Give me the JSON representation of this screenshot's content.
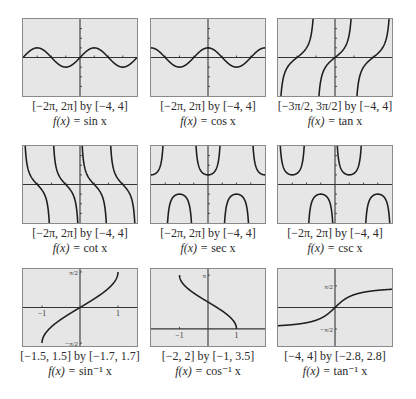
{
  "chart_data": [
    {
      "type": "line",
      "id": "sin",
      "title": "f(x) = sin x",
      "window_label": "[−2π, 2π] by [−4, 4]",
      "func_prefix": "f(x) = ",
      "func_name": "sin x",
      "xlim": [
        -6.2832,
        6.2832
      ],
      "ylim": [
        -4,
        4
      ],
      "x_ticks": [
        -4.712,
        -3.1416,
        -1.5708,
        1.5708,
        3.1416,
        4.712
      ],
      "y_ticks": [
        -3,
        -2,
        -1,
        1,
        2,
        3
      ],
      "tick_labels": [],
      "grid": false
    },
    {
      "type": "line",
      "id": "cos",
      "title": "f(x) = cos x",
      "window_label": "[−2π, 2π] by [−4, 4]",
      "func_prefix": "f(x) = ",
      "func_name": "cos x",
      "xlim": [
        -6.2832,
        6.2832
      ],
      "ylim": [
        -4,
        4
      ],
      "x_ticks": [
        -4.712,
        -3.1416,
        -1.5708,
        1.5708,
        3.1416,
        4.712
      ],
      "y_ticks": [
        -3,
        -2,
        -1,
        1,
        2,
        3
      ],
      "tick_labels": [],
      "grid": false
    },
    {
      "type": "line",
      "id": "tan",
      "title": "f(x) = tan x",
      "window_label": "[−3π/2, 3π/2] by [−4, 4]",
      "func_prefix": "f(x) = ",
      "func_name": "tan x",
      "xlim": [
        -4.7124,
        4.7124
      ],
      "ylim": [
        -4,
        4
      ],
      "x_ticks": [
        -3.1416,
        -1.5708,
        1.5708,
        3.1416
      ],
      "y_ticks": [
        -3,
        -2,
        -1,
        1,
        2,
        3
      ],
      "tick_labels": [],
      "grid": false
    },
    {
      "type": "line",
      "id": "cot",
      "title": "f(x) = cot x",
      "window_label": "[−2π, 2π] by [−4, 4]",
      "func_prefix": "f(x) = ",
      "func_name": "cot x",
      "xlim": [
        -6.2832,
        6.2832
      ],
      "ylim": [
        -4,
        4
      ],
      "x_ticks": [
        -4.712,
        -3.1416,
        -1.5708,
        1.5708,
        3.1416,
        4.712
      ],
      "y_ticks": [
        -3,
        -2,
        -1,
        1,
        2,
        3
      ],
      "tick_labels": [],
      "grid": false
    },
    {
      "type": "line",
      "id": "sec",
      "title": "f(x) = sec x",
      "window_label": "[−2π, 2π] by [−4, 4]",
      "func_prefix": "f(x) = ",
      "func_name": "sec x",
      "xlim": [
        -6.2832,
        6.2832
      ],
      "ylim": [
        -4,
        4
      ],
      "x_ticks": [
        -4.712,
        -3.1416,
        -1.5708,
        1.5708,
        3.1416,
        4.712
      ],
      "y_ticks": [
        -3,
        -2,
        -1,
        1,
        2,
        3
      ],
      "tick_labels": [],
      "grid": false
    },
    {
      "type": "line",
      "id": "csc",
      "title": "f(x) = csc x",
      "window_label": "[−2π, 2π] by [−4, 4]",
      "func_prefix": "f(x) = ",
      "func_name": "csc x",
      "xlim": [
        -6.2832,
        6.2832
      ],
      "ylim": [
        -4,
        4
      ],
      "x_ticks": [
        -4.712,
        -3.1416,
        -1.5708,
        1.5708,
        3.1416,
        4.712
      ],
      "y_ticks": [
        -3,
        -2,
        -1,
        1,
        2,
        3
      ],
      "tick_labels": [],
      "grid": false
    },
    {
      "type": "line",
      "id": "asin",
      "title": "f(x) = sin⁻¹ x",
      "window_label": "[−1.5, 1.5] by [−1.7, 1.7]",
      "func_prefix": "f(x) = ",
      "func_name": "sin⁻¹ x",
      "xlim": [
        -1.5,
        1.5
      ],
      "ylim": [
        -1.7,
        1.7
      ],
      "x_ticks": [
        -1,
        1
      ],
      "y_ticks": [
        -1.5708,
        1.5708
      ],
      "tick_labels": [
        {
          "axis": "x",
          "value": -1,
          "text": "−1"
        },
        {
          "axis": "x",
          "value": 1,
          "text": "1"
        },
        {
          "axis": "y",
          "value": 1.5708,
          "text": "π/2"
        },
        {
          "axis": "y",
          "value": -1.5708,
          "text": "−π/2"
        }
      ],
      "grid": false
    },
    {
      "type": "line",
      "id": "acos",
      "title": "f(x) = cos⁻¹ x",
      "window_label": "[−2, 2] by [−1, 3.5]",
      "func_prefix": "f(x) = ",
      "func_name": "cos⁻¹ x",
      "xlim": [
        -2,
        2
      ],
      "ylim": [
        -1,
        3.5
      ],
      "x_ticks": [
        -1,
        1
      ],
      "y_ticks": [
        3.1416
      ],
      "tick_labels": [
        {
          "axis": "x",
          "value": -1,
          "text": "−1"
        },
        {
          "axis": "x",
          "value": 1,
          "text": "1"
        },
        {
          "axis": "y",
          "value": 3.1416,
          "text": "π"
        }
      ],
      "grid": false
    },
    {
      "type": "line",
      "id": "atan",
      "title": "f(x) = tan⁻¹ x",
      "window_label": "[−4, 4] by [−2.8, 2.8]",
      "func_prefix": "f(x) = ",
      "func_name": "tan⁻¹ x",
      "xlim": [
        -4,
        4
      ],
      "ylim": [
        -2.8,
        2.8
      ],
      "x_ticks": [],
      "y_ticks": [
        -1.5708,
        1.5708
      ],
      "tick_labels": [
        {
          "axis": "y",
          "value": 1.5708,
          "text": "π/2"
        },
        {
          "axis": "y",
          "value": -1.5708,
          "text": "−π/2"
        }
      ],
      "grid": false
    }
  ],
  "style": {
    "plot_background": "#e6e6e6",
    "plot_border": "#8a8a8a",
    "axis_color": "#333333",
    "curve_color": "#1e1e1e"
  },
  "layout": {
    "panels": [
      {
        "left": 22,
        "top": 18
      },
      {
        "left": 150,
        "top": 18
      },
      {
        "left": 277,
        "top": 18
      },
      {
        "left": 22,
        "top": 145
      },
      {
        "left": 150,
        "top": 145
      },
      {
        "left": 277,
        "top": 145
      },
      {
        "left": 22,
        "top": 268
      },
      {
        "left": 150,
        "top": 268
      },
      {
        "left": 277,
        "top": 268
      }
    ]
  }
}
